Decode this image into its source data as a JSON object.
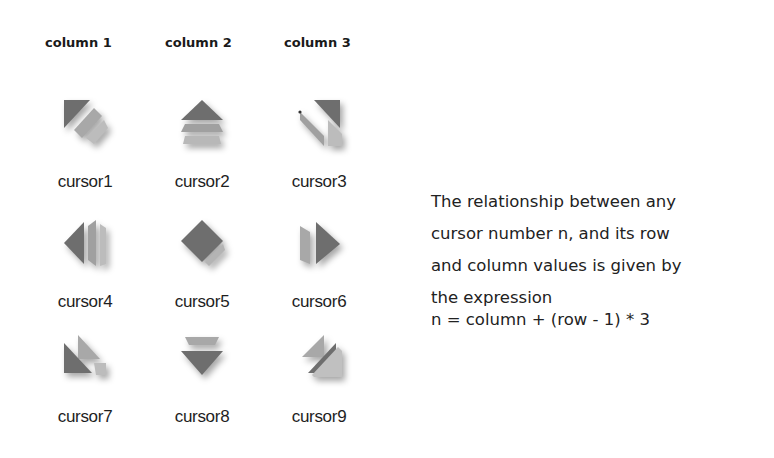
{
  "headers": [
    "column 1",
    "column 2",
    "column 3"
  ],
  "cursors": [
    {
      "label": "cursor1",
      "icon": "arrow-up-left-icon"
    },
    {
      "label": "cursor2",
      "icon": "arrow-up-icon"
    },
    {
      "label": "cursor3",
      "icon": "arrow-up-right-icon"
    },
    {
      "label": "cursor4",
      "icon": "arrow-left-icon"
    },
    {
      "label": "cursor5",
      "icon": "diamond-center-icon"
    },
    {
      "label": "cursor6",
      "icon": "arrow-right-icon"
    },
    {
      "label": "cursor7",
      "icon": "arrow-down-left-icon"
    },
    {
      "label": "cursor8",
      "icon": "arrow-down-icon"
    },
    {
      "label": "cursor9",
      "icon": "arrow-down-right-icon"
    }
  ],
  "description": {
    "lines": [
      "The relationship between any",
      "cursor number n, and its row",
      "and column values is given by",
      "the expression"
    ],
    "formula": "n = column + (row - 1) * 3"
  },
  "colors": {
    "icon_dark": "#6e6e6e",
    "icon_light": "#a8a8a8",
    "text": "#222222"
  }
}
